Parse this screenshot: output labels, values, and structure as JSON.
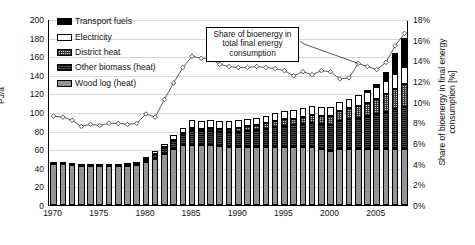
{
  "axes": {
    "y_left_label": "PJ/a",
    "y_right_label_line1": "Share of bioenergy in final energy",
    "y_right_label_line2": "consumption [%]",
    "y_left_ticks": [
      "200",
      "180",
      "160",
      "140",
      "120",
      "100",
      "80",
      "60",
      "40",
      "20",
      "0"
    ],
    "y_right_ticks": [
      "18%",
      "16%",
      "14%",
      "12%",
      "10%",
      "8%",
      "6%",
      "4%",
      "2%",
      "0%"
    ],
    "x_ticks": [
      "1970",
      "1975",
      "1980",
      "1985",
      "1990",
      "1995",
      "2000",
      "2005"
    ]
  },
  "legend": {
    "items": [
      {
        "label": "Transport fuels",
        "swatch": "transport-fuels-swatch",
        "color": "#000000"
      },
      {
        "label": "Electricity",
        "swatch": "electricity-swatch",
        "color": "#ffffff"
      },
      {
        "label": "District heat",
        "swatch": "district-heat-swatch",
        "color": "#c9c9c9"
      },
      {
        "label": "Other biomass (heat)",
        "swatch": "other-biomass-swatch",
        "color": "#101010"
      },
      {
        "label": "Wood log (heat)",
        "swatch": "wood-log-swatch",
        "color": "#949494"
      }
    ]
  },
  "annotation": {
    "text": "Share of bioenergy in total final energy consumption"
  },
  "chart_data": {
    "type": "bar",
    "title": "",
    "xlabel": "",
    "ylabel": "PJ/a",
    "y2label": "Share of bioenergy in final energy consumption [%]",
    "ylim": [
      0,
      200
    ],
    "y2lim": [
      0,
      18
    ],
    "grid": true,
    "legend_position": "upper-left",
    "categories": [
      1970,
      1971,
      1972,
      1973,
      1974,
      1975,
      1976,
      1977,
      1978,
      1979,
      1980,
      1981,
      1982,
      1983,
      1984,
      1985,
      1986,
      1987,
      1988,
      1989,
      1990,
      1991,
      1992,
      1993,
      1994,
      1995,
      1996,
      1997,
      1998,
      1999,
      2000,
      2001,
      2002,
      2003,
      2004,
      2005,
      2006,
      2007,
      2008
    ],
    "series": [
      {
        "name": "Wood log (heat)",
        "values": [
          44,
          44,
          43,
          42,
          42,
          42,
          42,
          42,
          42,
          43,
          46,
          50,
          55,
          60,
          64,
          65,
          64,
          64,
          63,
          62,
          62,
          62,
          62,
          62,
          62,
          62,
          62,
          62,
          62,
          60,
          58,
          60,
          60,
          60,
          60,
          60,
          60,
          60,
          60
        ]
      },
      {
        "name": "Other biomass (heat)",
        "values": [
          2,
          2,
          2,
          2,
          2,
          2,
          2,
          2,
          3,
          3,
          4,
          5,
          7,
          9,
          12,
          16,
          16,
          16,
          16,
          16,
          17,
          18,
          19,
          20,
          22,
          23,
          24,
          25,
          26,
          27,
          28,
          30,
          32,
          34,
          36,
          38,
          40,
          43,
          45
        ]
      },
      {
        "name": "District heat",
        "values": [
          0,
          0,
          0,
          0,
          0,
          0,
          0,
          0,
          0,
          0,
          0,
          0,
          0,
          1,
          1,
          2,
          2,
          3,
          3,
          4,
          4,
          5,
          5,
          6,
          6,
          7,
          7,
          8,
          9,
          9,
          10,
          11,
          12,
          13,
          14,
          16,
          19,
          22,
          25
        ]
      },
      {
        "name": "Electricity",
        "values": [
          0,
          0,
          0,
          0,
          0,
          0,
          0,
          0,
          0,
          0,
          2,
          3,
          4,
          5,
          6,
          8,
          8,
          8,
          8,
          8,
          8,
          8,
          8,
          8,
          9,
          9,
          9,
          9,
          9,
          9,
          9,
          10,
          10,
          11,
          12,
          13,
          14,
          16,
          18
        ]
      },
      {
        "name": "Transport fuels",
        "values": [
          0,
          0,
          0,
          0,
          0,
          0,
          0,
          0,
          0,
          0,
          0,
          0,
          0,
          0,
          0,
          0,
          0,
          0,
          0,
          0,
          0,
          0,
          0,
          0,
          0,
          0,
          0,
          0,
          0,
          0,
          0,
          0,
          0,
          0,
          1,
          3,
          10,
          22,
          32
        ]
      }
    ],
    "line_series": {
      "name": "Share of bioenergy in total final energy consumption",
      "unit": "%",
      "axis": "right",
      "values": [
        8.7,
        8.6,
        8.3,
        7.7,
        7.9,
        7.8,
        8.0,
        8.0,
        7.9,
        8.0,
        8.9,
        8.6,
        10.3,
        11.9,
        13.4,
        14.5,
        14.3,
        14.2,
        13.7,
        13.5,
        13.4,
        13.4,
        13.5,
        13.4,
        13.3,
        13.1,
        12.6,
        13.0,
        12.7,
        13.1,
        13.0,
        12.3,
        12.4,
        13.8,
        13.5,
        13.2,
        13.9,
        15.5,
        16.7
      ]
    }
  }
}
